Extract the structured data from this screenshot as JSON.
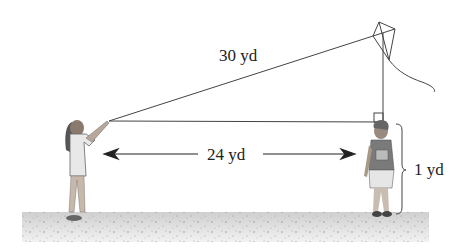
{
  "diagram": {
    "labels": {
      "hypotenuse": "30 yd",
      "horizontal": "24 yd",
      "height_offset": "1 yd"
    },
    "figures": [
      "girl-holding-kite-string",
      "child-standing-under-kite",
      "kite"
    ],
    "colors": {
      "line": "#444444",
      "ground": "#d9d9d9",
      "text": "#222222"
    }
  }
}
